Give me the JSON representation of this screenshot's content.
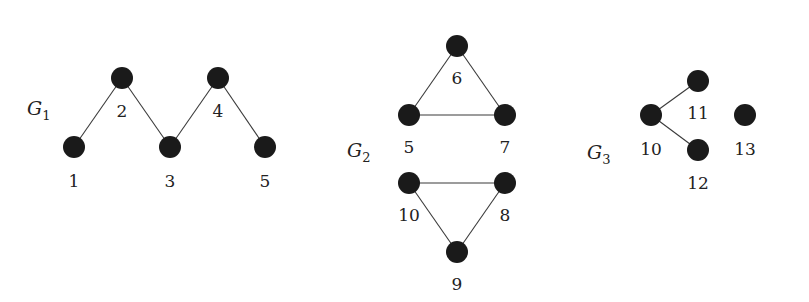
{
  "diagram": {
    "graphs": [
      {
        "id": "G1",
        "label": "G",
        "subscript": "1",
        "label_pos": [
          27,
          115
        ],
        "nodes": [
          {
            "id": "1",
            "x": 74,
            "y": 147,
            "lx": 74,
            "ly": 187
          },
          {
            "id": "2",
            "x": 122,
            "y": 78,
            "lx": 122,
            "ly": 117
          },
          {
            "id": "3",
            "x": 170,
            "y": 147,
            "lx": 170,
            "ly": 187
          },
          {
            "id": "4",
            "x": 218,
            "y": 78,
            "lx": 218,
            "ly": 117
          },
          {
            "id": "5",
            "x": 265,
            "y": 147,
            "lx": 265,
            "ly": 187
          }
        ],
        "edges": [
          [
            "1",
            "2"
          ],
          [
            "2",
            "3"
          ],
          [
            "3",
            "4"
          ],
          [
            "4",
            "5"
          ]
        ]
      },
      {
        "id": "G2",
        "label": "G",
        "subscript": "2",
        "label_pos": [
          347,
          157
        ],
        "nodes": [
          {
            "id": "6",
            "x": 457,
            "y": 46,
            "lx": 457,
            "ly": 84
          },
          {
            "id": "5",
            "x": 409,
            "y": 115,
            "lx": 409,
            "ly": 153
          },
          {
            "id": "7",
            "x": 505,
            "y": 115,
            "lx": 505,
            "ly": 153
          },
          {
            "id": "10",
            "x": 409,
            "y": 183,
            "lx": 409,
            "ly": 221
          },
          {
            "id": "8",
            "x": 505,
            "y": 183,
            "lx": 505,
            "ly": 221
          },
          {
            "id": "9",
            "x": 457,
            "y": 252,
            "lx": 457,
            "ly": 290
          }
        ],
        "edges": [
          [
            "6",
            "5"
          ],
          [
            "6",
            "7"
          ],
          [
            "5",
            "7"
          ],
          [
            "10",
            "8"
          ],
          [
            "10",
            "9"
          ],
          [
            "8",
            "9"
          ]
        ]
      },
      {
        "id": "G3",
        "label": "G",
        "subscript": "3",
        "label_pos": [
          587,
          159
        ],
        "nodes": [
          {
            "id": "10",
            "x": 651,
            "y": 115,
            "lx": 651,
            "ly": 155
          },
          {
            "id": "11",
            "x": 698,
            "y": 81,
            "lx": 698,
            "ly": 119
          },
          {
            "id": "12",
            "x": 698,
            "y": 150,
            "lx": 698,
            "ly": 189
          },
          {
            "id": "13",
            "x": 745,
            "y": 115,
            "lx": 745,
            "ly": 155
          }
        ],
        "edges": [
          [
            "10",
            "11"
          ],
          [
            "10",
            "12"
          ]
        ]
      }
    ],
    "node_radius": 11,
    "colors": {
      "node": "#1a1a1a",
      "edge": "#3a3a3a",
      "text": "#222222",
      "background": "#ffffff"
    }
  }
}
